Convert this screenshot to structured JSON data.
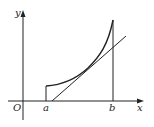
{
  "figure": {
    "type": "function-graph-with-tangent",
    "labels": {
      "y_axis": "y",
      "x_axis": "x",
      "origin": "O",
      "a": "a",
      "b": "b"
    },
    "colors": {
      "background": "#ffffff",
      "ink": "#222222"
    },
    "elements": [
      "x-axis with arrow",
      "y-axis with arrow",
      "convex increasing curve on [a, b]",
      "vertical segment at x = a",
      "vertical line at x = b",
      "tangent line touching curve at interior point"
    ]
  }
}
